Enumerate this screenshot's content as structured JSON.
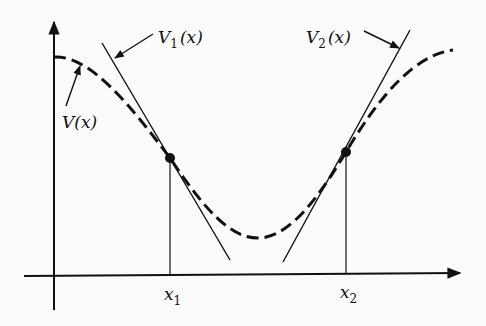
{
  "diagram": {
    "title": "",
    "curve": {
      "label": "V(x)",
      "style": "dashed"
    },
    "tangents": [
      {
        "label_main": "V",
        "label_sub": "1",
        "label_arg": "(x)",
        "at": "x_1"
      },
      {
        "label_main": "V",
        "label_sub": "2",
        "label_arg": "(x)",
        "at": "x_2"
      }
    ],
    "axis_ticks": [
      {
        "main": "x",
        "sub": "1"
      },
      {
        "main": "x",
        "sub": "2"
      }
    ],
    "colors": {
      "ink": "#111111",
      "background": "#fbfbfb"
    }
  }
}
